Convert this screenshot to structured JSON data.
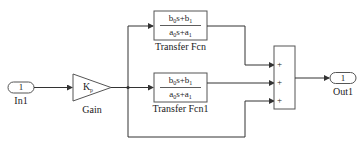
{
  "diagram": {
    "inport": {
      "number": "1",
      "label": "In1"
    },
    "gain": {
      "symbol": "K",
      "subscript": "p",
      "label": "Gain"
    },
    "tf1": {
      "num": "b0s+b1",
      "den": "a0s+a1",
      "label": "Transfer Fcn"
    },
    "tf2": {
      "num": "b0s+b1",
      "den": "a0s+a1",
      "label": "Transfer Fcn1"
    },
    "sum": {
      "signs": [
        "+",
        "+",
        "+"
      ]
    },
    "outport": {
      "number": "1",
      "label": "Out1"
    },
    "colors": {
      "line": "#333333",
      "block_border": "#555555",
      "background": "#ffffff"
    }
  }
}
